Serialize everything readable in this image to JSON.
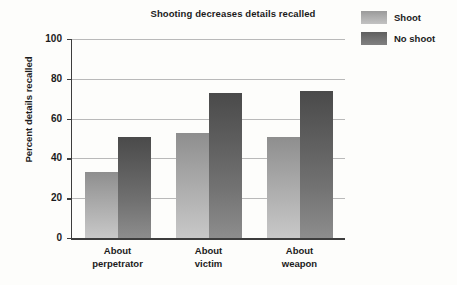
{
  "chart_data": {
    "type": "bar",
    "title": "Shooting decreases details recalled",
    "xlabel": "",
    "ylabel": "Percent details recalled",
    "categories": [
      "About perpetrator",
      "About victim",
      "About weapon"
    ],
    "category_lines": [
      [
        "About",
        "perpetrator"
      ],
      [
        "About",
        "victim"
      ],
      [
        "About",
        "weapon"
      ]
    ],
    "series": [
      {
        "name": "Shoot",
        "values": [
          33,
          53,
          51
        ],
        "color": "#adadad"
      },
      {
        "name": "No shoot",
        "values": [
          51,
          73,
          74
        ],
        "color": "#6f6f6f"
      }
    ],
    "ylim": [
      0,
      100
    ],
    "yticks": [
      0,
      20,
      40,
      60,
      80,
      100
    ],
    "ytick_labels": [
      "0",
      "20",
      "40",
      "60",
      "80",
      "100"
    ],
    "grid": true,
    "legend_position": "top-right",
    "orientation": "vertical",
    "grouping": "grouped"
  },
  "legend": {
    "items": [
      {
        "label": "Shoot",
        "swatch": "shoot"
      },
      {
        "label": "No shoot",
        "swatch": "noshoot"
      }
    ]
  }
}
